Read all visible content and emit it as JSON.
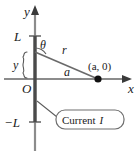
{
  "figure": {
    "type": "physics-diagram",
    "background_color": "#ffffff"
  },
  "axes": {
    "x_axis_label": "x",
    "y_axis_label": "y",
    "origin_label": "O",
    "axis_color": "#8c8c8c",
    "label_color": "#1a1a1a"
  },
  "ticks": {
    "y_upper_label": "L",
    "y_lower_label": "−L"
  },
  "labels": {
    "angle": "θ",
    "radius": "r",
    "segment_height": "y",
    "horizontal_distance": "a",
    "field_point": "(a, 0)"
  },
  "callout": {
    "text": "Current I",
    "text_plain": "Current",
    "symbol": "I",
    "border_color": "#6e6e6e",
    "fill_color": "#ffffff"
  },
  "elements": {
    "wire_color": "#4a4a4a",
    "ray_color": "#6a6a6a",
    "point_color": "#111111",
    "brace_color": "#5a5a5a"
  }
}
